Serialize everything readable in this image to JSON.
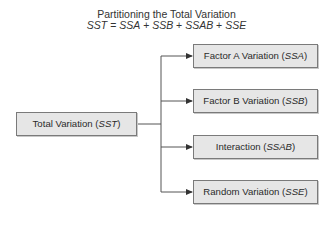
{
  "title": {
    "line1": "Partitioning the Total Variation",
    "equation": {
      "lhs": "SST",
      "equals": " = ",
      "terms": [
        "SSA",
        "SSB",
        "SSAB",
        "SSE"
      ],
      "plus": " + "
    }
  },
  "root": {
    "label": "Total Variation (",
    "symbol": "SST",
    "close": ")"
  },
  "children": [
    {
      "label": "Factor A Variation (",
      "symbol": "SSA",
      "close": ")"
    },
    {
      "label": "Factor B Variation (",
      "symbol": "SSB",
      "close": ")"
    },
    {
      "label": "Interaction (",
      "symbol": "SSAB",
      "close": ")"
    },
    {
      "label": "Random Variation (",
      "symbol": "SSE",
      "close": ")"
    }
  ],
  "colors": {
    "box_fill": "#e6e6e6",
    "box_border": "#7a7a7a",
    "line": "#555555"
  }
}
